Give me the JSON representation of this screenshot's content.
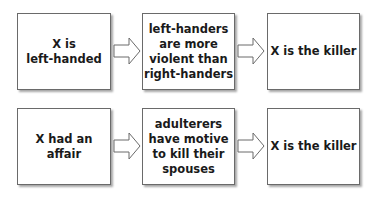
{
  "rows": [
    {
      "premise": "X is\nleft-handed",
      "generalization": "left-handers\nare more\nviolent than\nright-handers",
      "conclusion": "X is the killer"
    },
    {
      "premise": "X had an\naffair",
      "generalization": "adulterers\nhave motive\nto kill their\nspouses",
      "conclusion": "X is the killer"
    }
  ],
  "icons": {
    "arrow": "block-arrow-right-icon"
  }
}
